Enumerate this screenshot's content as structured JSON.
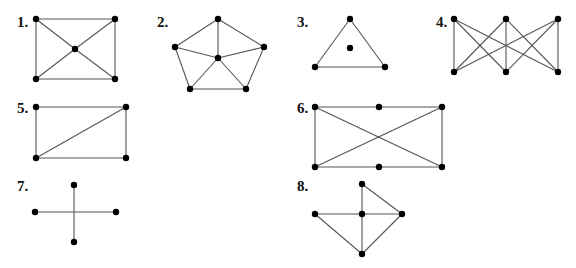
{
  "style": {
    "edge_color": "#555555",
    "vertex_color": "#000000",
    "background": "#ffffff",
    "vertex_radius": 3.2
  },
  "graphs": [
    {
      "label": "1.",
      "label_pos": [
        17,
        27
      ],
      "vertices": [
        [
          36,
          19
        ],
        [
          115,
          19
        ],
        [
          75,
          49
        ],
        [
          36,
          79
        ],
        [
          115,
          79
        ]
      ],
      "edges": [
        [
          0,
          1
        ],
        [
          0,
          3
        ],
        [
          1,
          4
        ],
        [
          3,
          4
        ],
        [
          0,
          2
        ],
        [
          1,
          2
        ],
        [
          2,
          3
        ],
        [
          2,
          4
        ]
      ]
    },
    {
      "label": "2.",
      "label_pos": [
        157,
        27
      ],
      "vertices": [
        [
          218,
          19
        ],
        [
          175,
          47
        ],
        [
          264,
          47
        ],
        [
          218,
          58
        ],
        [
          190,
          89
        ],
        [
          246,
          89
        ]
      ],
      "edges": [
        [
          0,
          1
        ],
        [
          0,
          2
        ],
        [
          0,
          3
        ],
        [
          1,
          3
        ],
        [
          2,
          3
        ],
        [
          1,
          4
        ],
        [
          2,
          5
        ],
        [
          4,
          5
        ],
        [
          3,
          4
        ],
        [
          3,
          5
        ]
      ]
    },
    {
      "label": "3.",
      "label_pos": [
        297,
        27
      ],
      "vertices": [
        [
          350,
          19
        ],
        [
          350,
          48
        ],
        [
          315,
          67
        ],
        [
          385,
          67
        ]
      ],
      "edges": [
        [
          0,
          2
        ],
        [
          0,
          3
        ],
        [
          2,
          3
        ]
      ]
    },
    {
      "label": "4.",
      "label_pos": [
        436,
        27
      ],
      "vertices": [
        [
          454,
          19
        ],
        [
          506,
          19
        ],
        [
          558,
          19
        ],
        [
          454,
          72
        ],
        [
          506,
          72
        ],
        [
          558,
          72
        ]
      ],
      "edges": [
        [
          0,
          3
        ],
        [
          0,
          4
        ],
        [
          0,
          5
        ],
        [
          1,
          3
        ],
        [
          1,
          4
        ],
        [
          1,
          5
        ],
        [
          2,
          3
        ],
        [
          2,
          4
        ],
        [
          2,
          5
        ]
      ]
    },
    {
      "label": "5.",
      "label_pos": [
        17,
        113
      ],
      "vertices": [
        [
          36,
          107
        ],
        [
          126,
          107
        ],
        [
          36,
          158
        ],
        [
          126,
          158
        ]
      ],
      "edges": [
        [
          0,
          1
        ],
        [
          0,
          2
        ],
        [
          1,
          3
        ],
        [
          2,
          3
        ],
        [
          1,
          2
        ]
      ]
    },
    {
      "label": "6.",
      "label_pos": [
        297,
        113
      ],
      "vertices": [
        [
          315,
          107
        ],
        [
          379,
          107
        ],
        [
          442,
          107
        ],
        [
          315,
          167
        ],
        [
          379,
          167
        ],
        [
          442,
          167
        ]
      ],
      "edges": [
        [
          0,
          1
        ],
        [
          1,
          2
        ],
        [
          3,
          4
        ],
        [
          4,
          5
        ],
        [
          0,
          3
        ],
        [
          2,
          5
        ],
        [
          0,
          5
        ],
        [
          2,
          3
        ]
      ]
    },
    {
      "label": "7.",
      "label_pos": [
        17,
        191
      ],
      "vertices": [
        [
          74,
          185
        ],
        [
          35,
          212
        ],
        [
          116,
          212
        ],
        [
          74,
          242
        ]
      ],
      "edges": [
        [
          0,
          3
        ],
        [
          1,
          2
        ]
      ]
    },
    {
      "label": "8.",
      "label_pos": [
        297,
        191
      ],
      "vertices": [
        [
          362,
          184
        ],
        [
          315,
          214
        ],
        [
          362,
          214
        ],
        [
          402,
          214
        ],
        [
          362,
          254
        ]
      ],
      "edges": [
        [
          0,
          2
        ],
        [
          0,
          3
        ],
        [
          1,
          2
        ],
        [
          2,
          3
        ],
        [
          2,
          4
        ],
        [
          1,
          4
        ],
        [
          3,
          4
        ]
      ]
    }
  ]
}
